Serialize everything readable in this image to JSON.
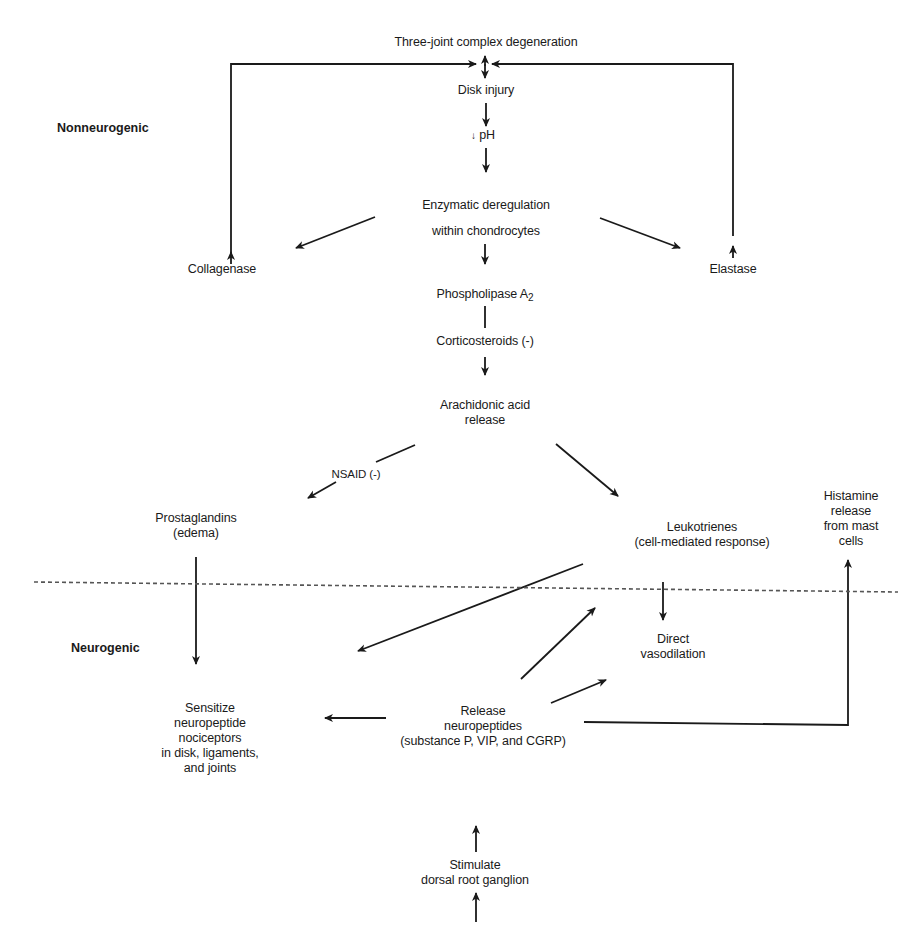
{
  "regions": {
    "upper": "Nonneurogenic",
    "lower": "Neurogenic"
  },
  "nodes": {
    "three_joint": "Three-joint complex degeneration",
    "disk_injury": "Disk injury",
    "ph_prefix": "↓",
    "ph": "pH",
    "enzymatic_1": "Enzymatic deregulation",
    "enzymatic_2": "within chondrocytes",
    "collagenase": "Collagenase",
    "elastase": "Elastase",
    "phospholipase": "Phospholipase A",
    "phospholipase_sub": "2",
    "corticosteroids": "Corticosteroids (-)",
    "arachidonic_1": "Arachidonic acid",
    "arachidonic_2": "release",
    "nsaid": "NSAID (-)",
    "prostaglandins_1": "Prostaglandins",
    "prostaglandins_2": "(edema)",
    "leukotrienes_1": "Leukotrienes",
    "leukotrienes_2": "(cell-mediated response)",
    "histamine_1": "Histamine",
    "histamine_2": "release",
    "histamine_3": "from mast",
    "histamine_4": "cells",
    "vasodilation_1": "Direct",
    "vasodilation_2": "vasodilation",
    "sensitize_1": "Sensitize",
    "sensitize_2": "neuropeptide",
    "sensitize_3": "nociceptors",
    "sensitize_4": "in disk, ligaments,",
    "sensitize_5": "and joints",
    "release_np_1": "Release",
    "release_np_2": "neuropeptides",
    "release_np_3": "(substance P, VIP, and CGRP)",
    "stimulate_1": "Stimulate",
    "stimulate_2": "dorsal root ganglion"
  },
  "edges": [
    {
      "from": "collagenase",
      "to": "three_joint"
    },
    {
      "from": "elastase",
      "to": "three_joint"
    },
    {
      "from": "three_joint",
      "to": "disk_injury"
    },
    {
      "from": "disk_injury",
      "to": "ph"
    },
    {
      "from": "ph",
      "to": "enzymatic"
    },
    {
      "from": "enzymatic",
      "to": "collagenase"
    },
    {
      "from": "enzymatic",
      "to": "elastase"
    },
    {
      "from": "enzymatic",
      "to": "phospholipase"
    },
    {
      "from": "phospholipase",
      "to": "corticosteroids",
      "type": "inhibit"
    },
    {
      "from": "corticosteroids",
      "to": "arachidonic"
    },
    {
      "from": "arachidonic",
      "to": "prostaglandins",
      "label": "NSAID (-)"
    },
    {
      "from": "arachidonic",
      "to": "leukotrienes"
    },
    {
      "from": "prostaglandins",
      "to": "sensitize"
    },
    {
      "from": "leukotrienes",
      "to": "sensitize"
    },
    {
      "from": "leukotrienes",
      "to": "vasodilation"
    },
    {
      "from": "release_np",
      "to": "leukotrienes"
    },
    {
      "from": "release_np",
      "to": "vasodilation"
    },
    {
      "from": "release_np",
      "to": "sensitize"
    },
    {
      "from": "release_np",
      "to": "histamine"
    },
    {
      "from": "stimulate",
      "to": "release_np"
    }
  ],
  "colors": {
    "ink": "#1a1a1a",
    "background": "#ffffff",
    "divider": "#555555"
  }
}
